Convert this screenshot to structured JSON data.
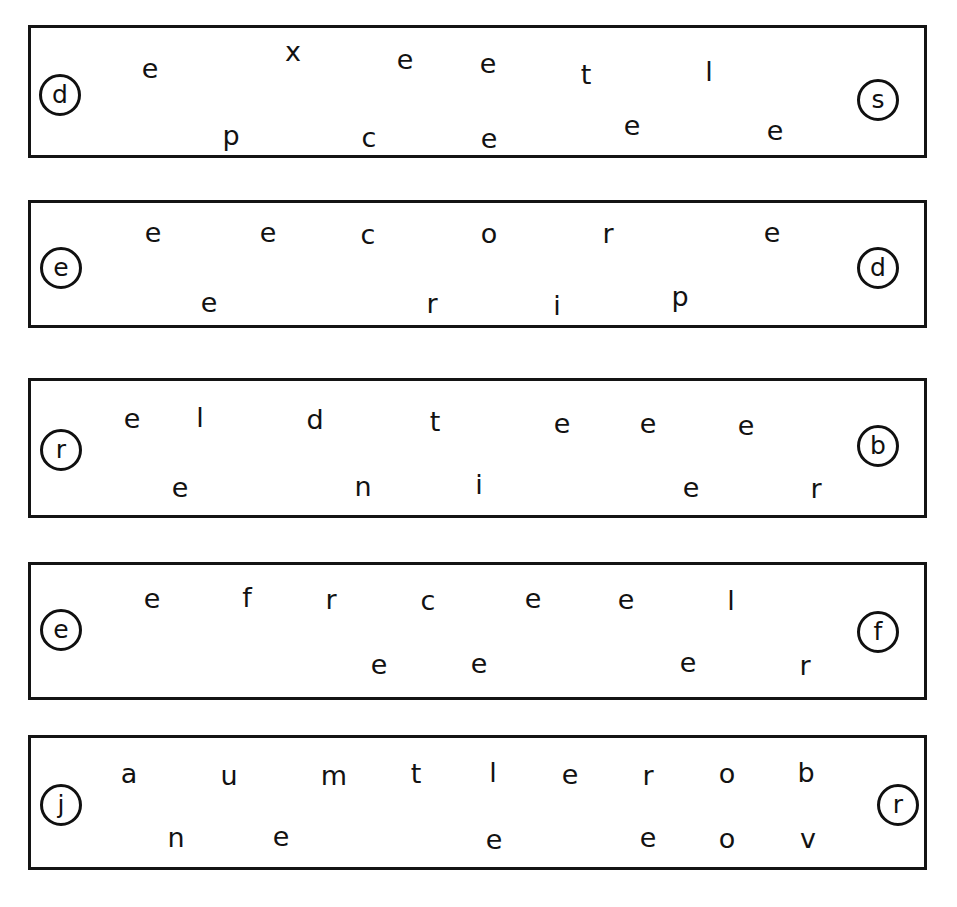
{
  "page": {
    "background_color": "#ffffff",
    "ink_color": "#121212",
    "border_color": "#141414",
    "width": 957,
    "height": 907
  },
  "rows": [
    {
      "id": "row-1",
      "box": {
        "x": 28,
        "y": 25,
        "width": 899,
        "height": 133
      },
      "left_cap": {
        "label": "d",
        "cx": 60,
        "cy": 95
      },
      "right_cap": {
        "label": "s",
        "cx": 878,
        "cy": 100
      },
      "letters": [
        {
          "char": "e",
          "x": 150,
          "y": 68
        },
        {
          "char": "x",
          "x": 293,
          "y": 51
        },
        {
          "char": "e",
          "x": 405,
          "y": 59
        },
        {
          "char": "e",
          "x": 488,
          "y": 63
        },
        {
          "char": "t",
          "x": 586,
          "y": 74
        },
        {
          "char": "l",
          "x": 709,
          "y": 71
        },
        {
          "char": "p",
          "x": 231,
          "y": 135
        },
        {
          "char": "c",
          "x": 369,
          "y": 137
        },
        {
          "char": "e",
          "x": 489,
          "y": 138
        },
        {
          "char": "e",
          "x": 632,
          "y": 125
        },
        {
          "char": "e",
          "x": 775,
          "y": 130
        }
      ]
    },
    {
      "id": "row-2",
      "box": {
        "x": 28,
        "y": 200,
        "width": 899,
        "height": 128
      },
      "left_cap": {
        "label": "e",
        "cx": 61,
        "cy": 268
      },
      "right_cap": {
        "label": "d",
        "cx": 878,
        "cy": 268
      },
      "letters": [
        {
          "char": "e",
          "x": 153,
          "y": 232
        },
        {
          "char": "e",
          "x": 268,
          "y": 232
        },
        {
          "char": "c",
          "x": 368,
          "y": 234
        },
        {
          "char": "o",
          "x": 489,
          "y": 233
        },
        {
          "char": "r",
          "x": 608,
          "y": 233
        },
        {
          "char": "e",
          "x": 772,
          "y": 232
        },
        {
          "char": "e",
          "x": 209,
          "y": 302
        },
        {
          "char": "r",
          "x": 432,
          "y": 303
        },
        {
          "char": "i",
          "x": 557,
          "y": 305
        },
        {
          "char": "p",
          "x": 680,
          "y": 296
        }
      ]
    },
    {
      "id": "row-3",
      "box": {
        "x": 28,
        "y": 378,
        "width": 899,
        "height": 140
      },
      "left_cap": {
        "label": "r",
        "cx": 61,
        "cy": 450
      },
      "right_cap": {
        "label": "b",
        "cx": 878,
        "cy": 446
      },
      "letters": [
        {
          "char": "e",
          "x": 132,
          "y": 418
        },
        {
          "char": "l",
          "x": 200,
          "y": 417
        },
        {
          "char": "d",
          "x": 315,
          "y": 419
        },
        {
          "char": "t",
          "x": 435,
          "y": 421
        },
        {
          "char": "e",
          "x": 562,
          "y": 423
        },
        {
          "char": "e",
          "x": 648,
          "y": 423
        },
        {
          "char": "e",
          "x": 746,
          "y": 425
        },
        {
          "char": "e",
          "x": 180,
          "y": 487
        },
        {
          "char": "n",
          "x": 363,
          "y": 486
        },
        {
          "char": "i",
          "x": 479,
          "y": 484
        },
        {
          "char": "e",
          "x": 691,
          "y": 487
        },
        {
          "char": "r",
          "x": 816,
          "y": 488
        }
      ]
    },
    {
      "id": "row-4",
      "box": {
        "x": 28,
        "y": 562,
        "width": 899,
        "height": 138
      },
      "left_cap": {
        "label": "e",
        "cx": 61,
        "cy": 630
      },
      "right_cap": {
        "label": "f",
        "cx": 878,
        "cy": 632
      },
      "letters": [
        {
          "char": "e",
          "x": 152,
          "y": 598
        },
        {
          "char": "f",
          "x": 247,
          "y": 597
        },
        {
          "char": "r",
          "x": 331,
          "y": 599
        },
        {
          "char": "c",
          "x": 428,
          "y": 600
        },
        {
          "char": "e",
          "x": 533,
          "y": 598
        },
        {
          "char": "e",
          "x": 626,
          "y": 599
        },
        {
          "char": "l",
          "x": 731,
          "y": 600
        },
        {
          "char": "e",
          "x": 379,
          "y": 664
        },
        {
          "char": "e",
          "x": 479,
          "y": 663
        },
        {
          "char": "e",
          "x": 688,
          "y": 662
        },
        {
          "char": "r",
          "x": 805,
          "y": 665
        }
      ]
    },
    {
      "id": "row-5",
      "box": {
        "x": 28,
        "y": 735,
        "width": 899,
        "height": 135
      },
      "left_cap": {
        "label": "j",
        "cx": 61,
        "cy": 805
      },
      "right_cap": {
        "label": "r",
        "cx": 898,
        "cy": 805
      },
      "letters": [
        {
          "char": "a",
          "x": 129,
          "y": 773
        },
        {
          "char": "u",
          "x": 229,
          "y": 775
        },
        {
          "char": "m",
          "x": 334,
          "y": 775
        },
        {
          "char": "t",
          "x": 416,
          "y": 773
        },
        {
          "char": "l",
          "x": 493,
          "y": 772
        },
        {
          "char": "e",
          "x": 570,
          "y": 774
        },
        {
          "char": "r",
          "x": 648,
          "y": 775
        },
        {
          "char": "o",
          "x": 727,
          "y": 773
        },
        {
          "char": "b",
          "x": 806,
          "y": 772
        },
        {
          "char": "n",
          "x": 176,
          "y": 837
        },
        {
          "char": "e",
          "x": 281,
          "y": 836
        },
        {
          "char": "e",
          "x": 494,
          "y": 839
        },
        {
          "char": "e",
          "x": 648,
          "y": 837
        },
        {
          "char": "o",
          "x": 727,
          "y": 838
        },
        {
          "char": "v",
          "x": 808,
          "y": 838
        }
      ]
    }
  ]
}
